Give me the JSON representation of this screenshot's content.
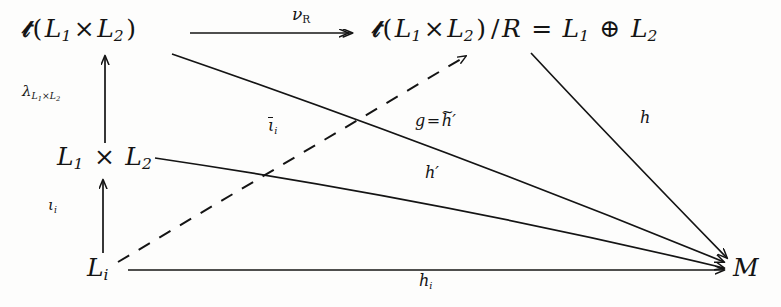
{
  "diagram": {
    "type": "commutative-diagram",
    "caption": "",
    "ink_color": "#141414",
    "background_color": "#fdfdfc",
    "nodes": [
      {
        "id": "top-left",
        "label": "D(L1 x L2)",
        "x": 22,
        "y": 16
      },
      {
        "id": "top-right",
        "label": "D(L1 x L2)/R = L1 + L2",
        "x": 372,
        "y": 16
      },
      {
        "id": "mid-left",
        "label": "L1 x L2",
        "x": 57,
        "y": 144
      },
      {
        "id": "bot-left",
        "label": "Li",
        "x": 87,
        "y": 255
      },
      {
        "id": "target",
        "label": "M",
        "x": 733,
        "y": 255
      }
    ],
    "edges": [
      {
        "id": "nu-R",
        "from": "top-left",
        "to": "top-right",
        "label": "nu_R",
        "style": "solid",
        "head": "double"
      },
      {
        "id": "lambda",
        "from": "mid-left",
        "to": "top-left",
        "label": "lambda_L1xL2",
        "style": "solid",
        "head": "single"
      },
      {
        "id": "iota",
        "from": "bot-left",
        "to": "mid-left",
        "label": "iota_i",
        "style": "solid",
        "head": "single"
      },
      {
        "id": "iota-bar",
        "from": "bot-left",
        "to": "top-right",
        "label": "iota-bar_i",
        "style": "dashed",
        "head": "single"
      },
      {
        "id": "g",
        "from": "top-left",
        "to": "target",
        "label": "g = h-tilde'",
        "style": "solid",
        "head": "single"
      },
      {
        "id": "h-prime",
        "from": "mid-left",
        "to": "target",
        "label": "h'",
        "style": "solid",
        "head": "single"
      },
      {
        "id": "h",
        "from": "top-right",
        "to": "target",
        "label": "h",
        "style": "solid",
        "head": "single"
      },
      {
        "id": "h-i",
        "from": "bot-left",
        "to": "target",
        "label": "h_i",
        "style": "solid",
        "head": "single"
      }
    ]
  },
  "labels": {
    "frak_d": "D",
    "lparen": "(",
    "rparen": ")",
    "times": "×",
    "slash_r": "/R",
    "equals": "=",
    "oplus": "⊕",
    "L": "L",
    "M": "M",
    "sub_1": "1",
    "sub_2": "2",
    "sub_i": "i",
    "nu": "ν",
    "sub_R": "R",
    "lambda": "λ",
    "lambda_sub": "L",
    "iota": "ι",
    "g": "g",
    "h": "h",
    "prime": "′",
    "tilde": "~"
  }
}
